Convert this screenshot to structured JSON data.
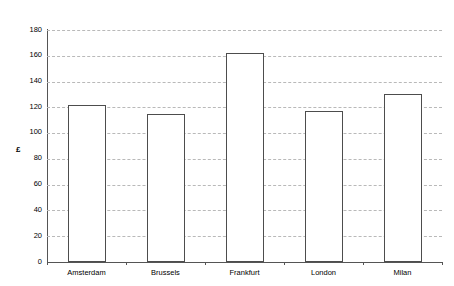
{
  "chart_data": {
    "type": "bar",
    "title": "",
    "subtitle": "",
    "xlabel": "",
    "ylabel": "£",
    "categories": [
      "Amsterdam",
      "Brussels",
      "Frankfurt",
      "London",
      "Milan"
    ],
    "values": [
      122,
      115,
      162,
      117,
      130
    ],
    "ylim": [
      0,
      180
    ],
    "ytick_step": 20,
    "yticks": [
      0,
      20,
      40,
      60,
      80,
      100,
      120,
      140,
      160,
      180
    ],
    "ytick_labels": [
      "0",
      "20",
      "40",
      "60",
      "80",
      "100",
      "120",
      "140",
      "160",
      "180"
    ],
    "grid": true,
    "grid_axis": "y",
    "grid_style": "dashed",
    "legend": false,
    "legend_position": "none",
    "series": [
      {
        "name": "",
        "values": [
          122,
          115,
          162,
          117,
          130
        ]
      }
    ],
    "colors": {
      "bar_fill": "#ffffff",
      "bar_edge": "#4d4d4d",
      "gridline": "#b9b9b9",
      "axis": "#555555",
      "text": "#000000",
      "background": "#ffffff"
    }
  }
}
